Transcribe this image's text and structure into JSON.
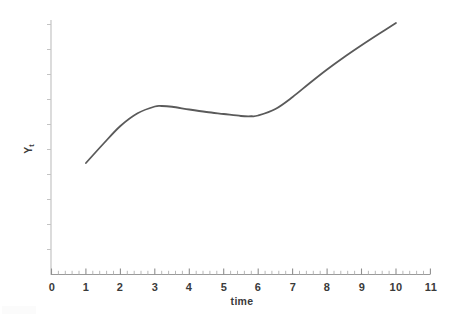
{
  "chart_data": {
    "type": "line",
    "title": "",
    "xlabel": "time",
    "ylabel": "Y",
    "ylabel_sub": "t",
    "xlim": [
      0,
      11
    ],
    "ylim": [
      0,
      10
    ],
    "grid": false,
    "legend": null,
    "x_ticks": [
      0,
      1,
      2,
      3,
      4,
      5,
      6,
      7,
      8,
      9,
      10,
      11
    ],
    "x_tick_labels": [
      "0",
      "1",
      "2",
      "3",
      "4",
      "5",
      "6",
      "7",
      "8",
      "9",
      "10",
      "11"
    ],
    "x_minor_ticks_per_interval": 5,
    "y_ticks_count": 10,
    "y_tick_labels": [],
    "series": [
      {
        "name": "Y_t",
        "color": "#5a5a5a",
        "line_width": 1.8,
        "x": [
          1.0,
          1.5,
          2.0,
          2.5,
          3.0,
          3.2,
          3.5,
          4.0,
          4.5,
          5.0,
          5.5,
          5.8,
          6.0,
          6.5,
          7.0,
          7.5,
          8.0,
          8.5,
          9.0,
          9.5,
          10.0
        ],
        "y": [
          4.46,
          5.22,
          5.94,
          6.45,
          6.72,
          6.74,
          6.71,
          6.6,
          6.5,
          6.42,
          6.34,
          6.33,
          6.36,
          6.62,
          7.1,
          7.66,
          8.2,
          8.7,
          9.17,
          9.62,
          10.06
        ]
      }
    ],
    "annotations": []
  },
  "axes": {
    "x_axis_color": "#9a9a9a",
    "y_axis_color": "#bdbdbd",
    "tick_color": "#a8a8a8"
  }
}
